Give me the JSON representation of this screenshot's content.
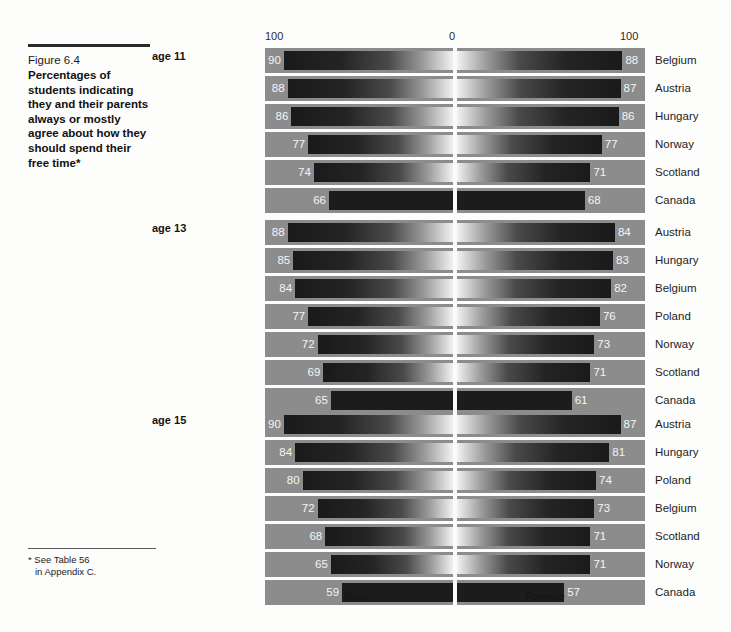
{
  "caption": {
    "figure_number": "Figure 6.4",
    "title": "Percentages of students indicating they and their parents always or mostly agree about how they should spend their free time*"
  },
  "footnote": {
    "line1": "* See Table 56",
    "line2": "in Appendix C."
  },
  "axis": {
    "left_tick": "100",
    "center_tick": "0",
    "right_tick": "100"
  },
  "legend": {
    "male": "Male",
    "female": "Female"
  },
  "colors": {
    "band": "#8c8c8c",
    "bar_dark": "#1a1a1a",
    "highlight_bar": "#1c1c1c",
    "page": "#fdfdfc",
    "text": "#1b1b1b",
    "value_text": "#f4f4f4"
  },
  "chart_data": {
    "type": "bar",
    "title": "Percentages of students indicating they and their parents always or mostly agree about how they should spend their free time",
    "xlabel": "",
    "ylabel": "",
    "orientation": "horizontal",
    "layout": "bidirectional butterfly, Male to the left of centre, Female to the right",
    "xlim": [
      0,
      100
    ],
    "axis_ticks": [
      "100",
      "0",
      "100"
    ],
    "grid": false,
    "legend_position": "bottom",
    "series": [
      {
        "name": "Male"
      },
      {
        "name": "Female"
      }
    ],
    "highlight_country": "Canada",
    "panels": [
      {
        "age_label": "age 11",
        "rows": [
          {
            "left_country": "Austria",
            "male": 90,
            "right_country": "Belgium",
            "female": 88,
            "highlight": false
          },
          {
            "left_country": "Hungary",
            "male": 88,
            "right_country": "Austria",
            "female": 87,
            "highlight": false
          },
          {
            "left_country": "Belgium",
            "male": 86,
            "right_country": "Hungary",
            "female": 86,
            "highlight": false
          },
          {
            "left_country": "Norway",
            "male": 77,
            "right_country": "Norway",
            "female": 77,
            "highlight": false
          },
          {
            "left_country": "Scotland",
            "male": 74,
            "right_country": "Scotland",
            "female": 71,
            "highlight": false
          },
          {
            "left_country": "Canada",
            "male": 66,
            "right_country": "Canada",
            "female": 68,
            "highlight": true
          }
        ]
      },
      {
        "age_label": "age 13",
        "rows": [
          {
            "left_country": "Austria",
            "male": 88,
            "right_country": "Austria",
            "female": 84,
            "highlight": false
          },
          {
            "left_country": "Hungary",
            "male": 85,
            "right_country": "Hungary",
            "female": 83,
            "highlight": false
          },
          {
            "left_country": "Belgium",
            "male": 84,
            "right_country": "Belgium",
            "female": 82,
            "highlight": false
          },
          {
            "left_country": "Poland",
            "male": 77,
            "right_country": "Poland",
            "female": 76,
            "highlight": false
          },
          {
            "left_country": "Norway",
            "male": 72,
            "right_country": "Norway",
            "female": 73,
            "highlight": false
          },
          {
            "left_country": "Scotland",
            "male": 69,
            "right_country": "Scotland",
            "female": 71,
            "highlight": false
          },
          {
            "left_country": "Canada",
            "male": 65,
            "right_country": "Canada",
            "female": 61,
            "highlight": true
          }
        ]
      },
      {
        "age_label": "age 15",
        "rows": [
          {
            "left_country": "Austria",
            "male": 90,
            "right_country": "Austria",
            "female": 87,
            "highlight": false
          },
          {
            "left_country": "Belgium",
            "male": 84,
            "right_country": "Hungary",
            "female": 81,
            "highlight": false
          },
          {
            "left_country": "Hungary",
            "male": 80,
            "right_country": "Poland",
            "female": 74,
            "highlight": false
          },
          {
            "left_country": "Poland",
            "male": 72,
            "right_country": "Belgium",
            "female": 73,
            "highlight": false
          },
          {
            "left_country": "Scotland",
            "male": 68,
            "right_country": "Scotland",
            "female": 71,
            "highlight": false
          },
          {
            "left_country": "Norway",
            "male": 65,
            "right_country": "Norway",
            "female": 71,
            "highlight": false
          },
          {
            "left_country": "Canada",
            "male": 59,
            "right_country": "Canada",
            "female": 57,
            "highlight": true
          }
        ]
      }
    ]
  }
}
